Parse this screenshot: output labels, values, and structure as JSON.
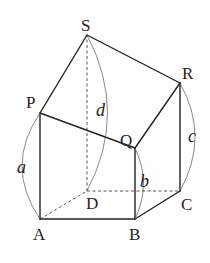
{
  "diagram": {
    "type": "solid-figure",
    "vertices": {
      "S": {
        "label": "S",
        "x": 87,
        "y": 35
      },
      "P": {
        "label": "P",
        "x": 40,
        "y": 113
      },
      "R": {
        "label": "R",
        "x": 180,
        "y": 83
      },
      "Q": {
        "label": "Q",
        "x": 135,
        "y": 148
      },
      "A": {
        "label": "A",
        "x": 40,
        "y": 219
      },
      "B": {
        "label": "B",
        "x": 135,
        "y": 219
      },
      "C": {
        "label": "C",
        "x": 180,
        "y": 191
      },
      "D": {
        "label": "D",
        "x": 87,
        "y": 191
      }
    },
    "lengths": {
      "a": {
        "label": "a",
        "edge": "AP"
      },
      "b": {
        "label": "b",
        "edge": "BQ"
      },
      "c": {
        "label": "c",
        "edge": "CR"
      },
      "d": {
        "label": "d",
        "edge": "DS"
      }
    },
    "visible_edges": [
      "PS",
      "SR",
      "PQ",
      "QR",
      "AP",
      "BQ",
      "CR",
      "AB",
      "BC"
    ],
    "hidden_edges": [
      "DS",
      "AD",
      "DC"
    ]
  }
}
